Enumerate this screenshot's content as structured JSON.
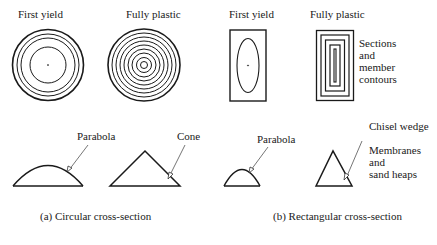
{
  "panels": {
    "circular": {
      "first_yield_label": "First yield",
      "fully_plastic_label": "Fully plastic",
      "parabola_label": "Parabola",
      "cone_label": "Cone",
      "caption": "(a) Circular cross-section"
    },
    "rectangular": {
      "first_yield_label": "First yield",
      "fully_plastic_label": "Fully plastic",
      "note_lines": [
        "Sections",
        "and",
        "member",
        "contours"
      ],
      "parabola_label": "Parabola",
      "chisel_label": "Chisel wedge",
      "membranes_lines": [
        "Membranes",
        "and",
        "sand heaps"
      ],
      "caption": "(b) Rectangular cross-section"
    }
  },
  "colors": {
    "line": "#1a1a1a",
    "background": "#ffffff"
  }
}
